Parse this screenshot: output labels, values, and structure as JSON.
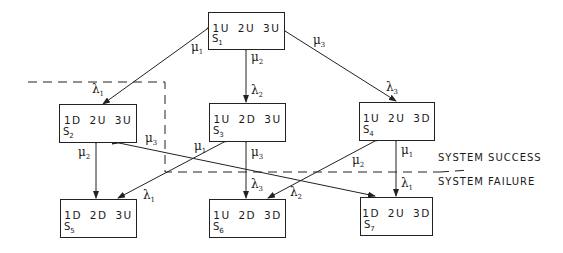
{
  "diagram": {
    "title": "",
    "states": [
      {
        "id": "S1",
        "label_main": "S",
        "label_sub": "1",
        "status": "1U 2U 3U"
      },
      {
        "id": "S2",
        "label_main": "S",
        "label_sub": "2",
        "status": "1D 2U 3U"
      },
      {
        "id": "S3",
        "label_main": "S",
        "label_sub": "3",
        "status": "1U 2D 3U"
      },
      {
        "id": "S4",
        "label_main": "S",
        "label_sub": "4",
        "status": "1U 2U 3D"
      },
      {
        "id": "S5",
        "label_main": "S",
        "label_sub": "5",
        "status": "1D 2D 3U"
      },
      {
        "id": "S6",
        "label_main": "S",
        "label_sub": "6",
        "status": "1U 2D 3D"
      },
      {
        "id": "S7",
        "label_main": "S",
        "label_sub": "7",
        "status": "1D 2U 3D"
      }
    ],
    "rates": {
      "mu1_a": {
        "sym": "μ",
        "sub": "1"
      },
      "lam1_a": {
        "sym": "λ",
        "sub": "1"
      },
      "mu2_a": {
        "sym": "μ",
        "sub": "2"
      },
      "lam2_a": {
        "sym": "λ",
        "sub": "2"
      },
      "mu3_a": {
        "sym": "μ",
        "sub": "3"
      },
      "lam3_a": {
        "sym": "λ",
        "sub": "3"
      },
      "mu2_b": {
        "sym": "μ",
        "sub": "2"
      },
      "mu3_b": {
        "sym": "μ",
        "sub": "3"
      },
      "mu1_b": {
        "sym": "μ",
        "sub": "1"
      },
      "mu3_c": {
        "sym": "μ",
        "sub": "3"
      },
      "mu1_c": {
        "sym": "μ",
        "sub": "1"
      },
      "lam1_b": {
        "sym": "λ",
        "sub": "1"
      },
      "lam3_b": {
        "sym": "λ",
        "sub": "3"
      },
      "mu2_c": {
        "sym": "μ",
        "sub": "2"
      },
      "lam2_b": {
        "sym": "λ",
        "sub": "2"
      },
      "lam1_c": {
        "sym": "λ",
        "sub": "1"
      }
    },
    "zones": {
      "success": "SYSTEM SUCCESS",
      "failure": "SYSTEM FAILURE"
    }
  }
}
